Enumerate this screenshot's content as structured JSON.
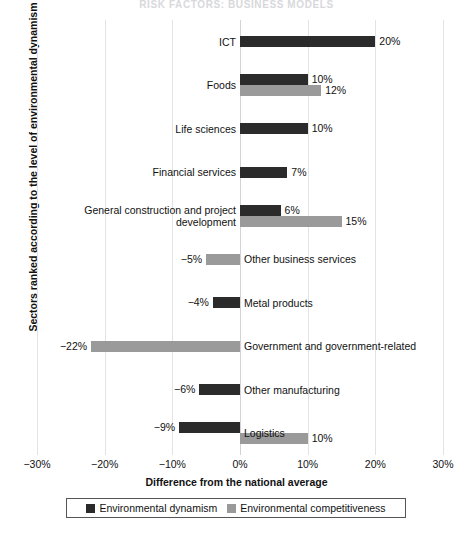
{
  "page": {
    "running_header": "Risk Factors: Business Models"
  },
  "chart_data": {
    "type": "bar",
    "orientation": "horizontal",
    "title": "",
    "xlabel": "Difference from the national average",
    "ylabel": "Sectors ranked according to the level of environmental dynamism",
    "xlim": [
      -30,
      30
    ],
    "xticks": [
      "−30%",
      "−20%",
      "−10%",
      "0%",
      "10%",
      "20%",
      "30%"
    ],
    "xtick_values": [
      -30,
      -20,
      -10,
      0,
      10,
      20,
      30
    ],
    "grid": true,
    "legend_position": "bottom",
    "series": [
      {
        "name": "Environmental dynamism",
        "color": "#2b2b2b",
        "values": [
          20,
          10,
          10,
          7,
          6,
          null,
          -4,
          null,
          -6,
          -9
        ]
      },
      {
        "name": "Environmental competitiveness",
        "color": "#9a9a9a",
        "values": [
          null,
          12,
          null,
          null,
          15,
          -5,
          null,
          -22,
          null,
          10
        ]
      }
    ],
    "categories": [
      "ICT",
      "Foods",
      "Life sciences",
      "Financial services",
      "General construction and project\ndevelopment",
      "Other business services",
      "Metal products",
      "Government and government-related",
      "Other manufacturing",
      "Logistics"
    ],
    "rows": [
      {
        "category": "ICT",
        "label_side": "left",
        "bars": [
          {
            "series": "Environmental dynamism",
            "value": 20,
            "label": "20%",
            "label_side": "right"
          }
        ]
      },
      {
        "category": "Foods",
        "label_side": "left",
        "bars": [
          {
            "series": "Environmental dynamism",
            "value": 10,
            "label": "10%",
            "label_side": "right"
          },
          {
            "series": "Environmental competitiveness",
            "value": 12,
            "label": "12%",
            "label_side": "right"
          }
        ]
      },
      {
        "category": "Life sciences",
        "label_side": "left",
        "bars": [
          {
            "series": "Environmental dynamism",
            "value": 10,
            "label": "10%",
            "label_side": "right"
          }
        ]
      },
      {
        "category": "Financial services",
        "label_side": "left",
        "bars": [
          {
            "series": "Environmental dynamism",
            "value": 7,
            "label": "7%",
            "label_side": "right"
          }
        ]
      },
      {
        "category": "General construction and project\ndevelopment",
        "label_side": "left",
        "bars": [
          {
            "series": "Environmental dynamism",
            "value": 6,
            "label": "6%",
            "label_side": "right"
          },
          {
            "series": "Environmental competitiveness",
            "value": 15,
            "label": "15%",
            "label_side": "right"
          }
        ]
      },
      {
        "category": "Other business services",
        "label_side": "right",
        "bars": [
          {
            "series": "Environmental competitiveness",
            "value": -5,
            "label": "−5%",
            "label_side": "left"
          }
        ]
      },
      {
        "category": "Metal products",
        "label_side": "right",
        "bars": [
          {
            "series": "Environmental dynamism",
            "value": -4,
            "label": "−4%",
            "label_side": "left"
          }
        ]
      },
      {
        "category": "Government and government-related",
        "label_side": "right",
        "bars": [
          {
            "series": "Environmental competitiveness",
            "value": -22,
            "label": "−22%",
            "label_side": "left"
          }
        ]
      },
      {
        "category": "Other manufacturing",
        "label_side": "right",
        "bars": [
          {
            "series": "Environmental dynamism",
            "value": -6,
            "label": "−6%",
            "label_side": "left"
          }
        ]
      },
      {
        "category": "Logistics",
        "label_side": "right",
        "bars": [
          {
            "series": "Environmental dynamism",
            "value": -9,
            "label": "−9%",
            "label_side": "left"
          },
          {
            "series": "Environmental competitiveness",
            "value": 10,
            "label": "10%",
            "label_side": "right"
          }
        ]
      }
    ],
    "legend": [
      {
        "name": "Environmental dynamism",
        "color": "#2b2b2b"
      },
      {
        "name": "Environmental competitiveness",
        "color": "#9a9a9a"
      }
    ]
  }
}
